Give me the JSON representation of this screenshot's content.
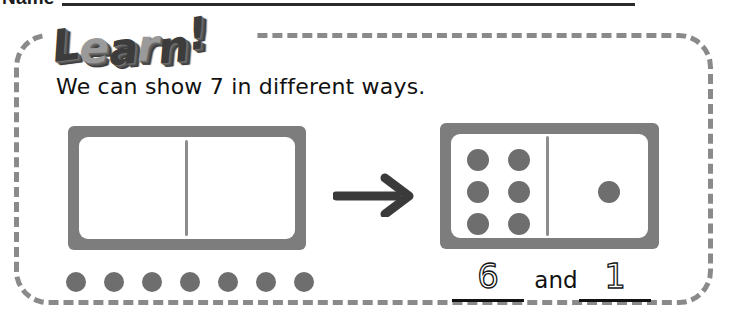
{
  "worksheet": {
    "name_label": "Name",
    "banner_title": "Learn!",
    "banner_letters": [
      "L",
      "e",
      "a",
      "r",
      "n",
      "!"
    ],
    "instruction": "We can show 7 in different ways.",
    "target_number": 7
  },
  "left_mat": {
    "name": "empty-part-part-whole-mat",
    "left_section_dots": 0,
    "right_section_dots": 0,
    "divider": true
  },
  "counters": {
    "label": "seven-counters-row",
    "count": 7,
    "color": "#6e6e6e"
  },
  "arrow": {
    "direction": "right",
    "color": "#3a3a3a"
  },
  "right_domino": {
    "name": "domino-six-and-one",
    "left_section_dots": 6,
    "right_section_dots": 1,
    "total": 7,
    "dot_color": "#6e6e6e",
    "frame_color": "#7d7d7d"
  },
  "answer": {
    "first_value": "6",
    "connector": "and",
    "second_value": "1",
    "style": "dotted-trace"
  },
  "colors": {
    "frame_gray": "#7d7d7d",
    "dot_gray": "#6e6e6e",
    "border_dash": "#8a8a8a",
    "ink": "#111111",
    "banner_dark": "#3c3c3c",
    "banner_light": "#9a9a9a"
  }
}
